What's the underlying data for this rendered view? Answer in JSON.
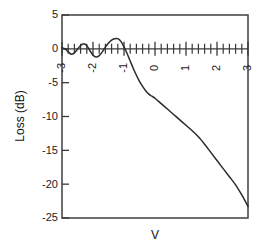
{
  "chart_data": {
    "type": "line",
    "title": "",
    "xlabel": "V",
    "ylabel": "Loss (dB)",
    "xlim": [
      -3,
      3
    ],
    "ylim": [
      -25,
      5
    ],
    "xticks": [
      -3,
      -2,
      -1,
      0,
      1,
      2,
      3
    ],
    "xtick_labels": [
      "-3",
      "-2",
      "-1",
      "0",
      "1",
      "2",
      "3"
    ],
    "yticks": [
      5,
      0,
      -5,
      -10,
      -15,
      -20,
      -25
    ],
    "ytick_labels": [
      "5",
      "0",
      "-5",
      "-10",
      "-15",
      "-20",
      "-25"
    ],
    "x_minor_per_unit": 5,
    "grid": false,
    "legend": null,
    "line_color": "#2b2b2b",
    "axis_color": "#3a3a3a",
    "series": [
      {
        "name": "Loss",
        "x": [
          -3.0,
          -2.9,
          -2.8,
          -2.7,
          -2.6,
          -2.5,
          -2.4,
          -2.3,
          -2.2,
          -2.1,
          -2.0,
          -1.9,
          -1.8,
          -1.7,
          -1.6,
          -1.5,
          -1.4,
          -1.3,
          -1.2,
          -1.1,
          -1.0,
          -0.9,
          -0.8,
          -0.7,
          -0.6,
          -0.5,
          -0.4,
          -0.3,
          -0.2,
          -0.1,
          0.0,
          0.2,
          0.4,
          0.6,
          0.8,
          1.0,
          1.2,
          1.4,
          1.6,
          1.8,
          2.0,
          2.2,
          2.4,
          2.6,
          2.8,
          3.0
        ],
        "y": [
          0.15,
          0.0,
          -0.45,
          -0.8,
          -0.6,
          -0.05,
          0.5,
          0.75,
          0.45,
          -0.25,
          -0.95,
          -1.2,
          -1.0,
          -0.45,
          0.25,
          0.85,
          1.3,
          1.5,
          1.5,
          1.1,
          0.3,
          -0.7,
          -1.8,
          -2.9,
          -3.9,
          -4.8,
          -5.55,
          -6.2,
          -6.7,
          -7.0,
          -7.3,
          -8.1,
          -8.9,
          -9.7,
          -10.5,
          -11.3,
          -12.1,
          -13.0,
          -14.1,
          -15.3,
          -16.5,
          -17.7,
          -18.9,
          -20.1,
          -21.6,
          -23.3
        ]
      }
    ]
  }
}
